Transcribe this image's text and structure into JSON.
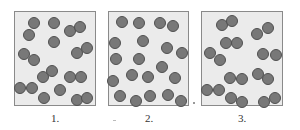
{
  "diagram": {
    "colors": {
      "box_fill": "#ebebeb",
      "box_border": "#8a8a8a",
      "particle_fill": "#787878",
      "particle_stroke": "#505050"
    },
    "particle_radius": 6,
    "boxes": [
      {
        "label": "1.",
        "x": 14,
        "width": 81,
        "particles": [
          [
            34,
            23
          ],
          [
            54,
            23
          ],
          [
            70,
            31
          ],
          [
            80,
            27
          ],
          [
            29,
            35
          ],
          [
            54,
            42
          ],
          [
            24,
            54
          ],
          [
            34,
            60
          ],
          [
            77,
            53
          ],
          [
            87,
            48
          ],
          [
            43,
            77
          ],
          [
            52,
            71
          ],
          [
            70,
            77
          ],
          [
            81,
            77
          ],
          [
            20,
            88
          ],
          [
            32,
            88
          ],
          [
            44,
            98
          ],
          [
            60,
            90
          ],
          [
            77,
            100
          ],
          [
            87,
            98
          ]
        ]
      },
      {
        "label": "2.",
        "x": 108,
        "width": 80,
        "particles": [
          [
            122,
            22
          ],
          [
            139,
            23
          ],
          [
            160,
            23
          ],
          [
            173,
            26
          ],
          [
            115,
            43
          ],
          [
            143,
            41
          ],
          [
            167,
            48
          ],
          [
            182,
            53
          ],
          [
            116,
            59
          ],
          [
            139,
            59
          ],
          [
            162,
            67
          ],
          [
            132,
            75
          ],
          [
            148,
            77
          ],
          [
            175,
            78
          ],
          [
            113,
            81
          ],
          [
            120,
            96
          ],
          [
            136,
            101
          ],
          [
            150,
            96
          ],
          [
            168,
            95
          ],
          [
            181,
            101
          ]
        ]
      },
      {
        "label": "3.",
        "x": 201,
        "width": 81,
        "particles": [
          [
            222,
            25
          ],
          [
            232,
            21
          ],
          [
            257,
            34
          ],
          [
            268,
            28
          ],
          [
            226,
            43
          ],
          [
            237,
            43
          ],
          [
            210,
            53
          ],
          [
            220,
            60
          ],
          [
            263,
            54
          ],
          [
            276,
            55
          ],
          [
            230,
            78
          ],
          [
            242,
            79
          ],
          [
            258,
            74
          ],
          [
            268,
            79
          ],
          [
            207,
            90
          ],
          [
            219,
            90
          ],
          [
            231,
            98
          ],
          [
            242,
            102
          ],
          [
            264,
            102
          ],
          [
            275,
            98
          ]
        ]
      }
    ]
  }
}
